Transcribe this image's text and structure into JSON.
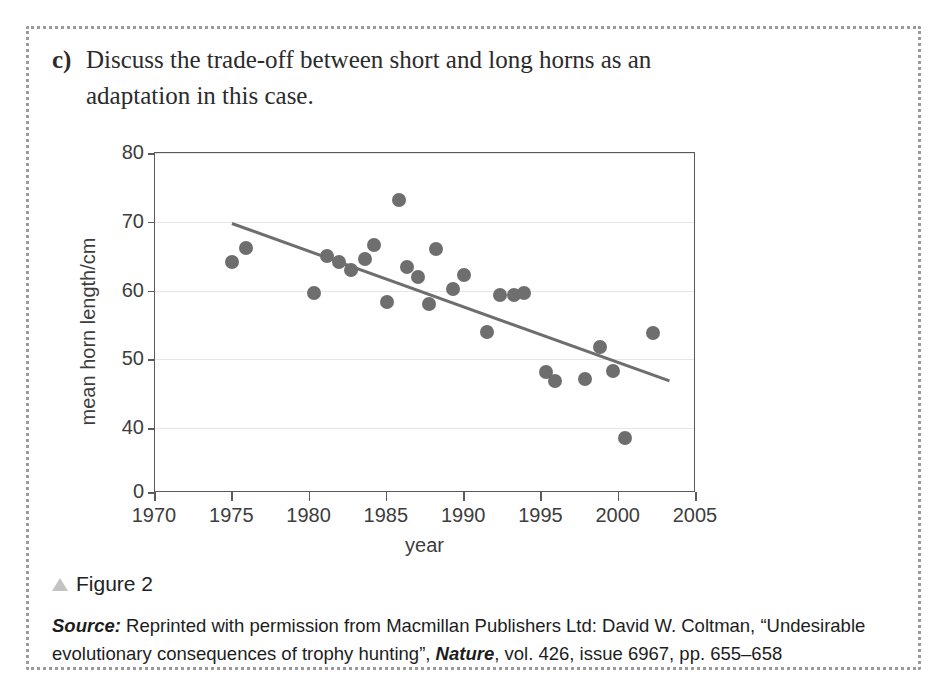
{
  "question": {
    "label": "c)",
    "text": "Discuss the trade-off between short and long horns as an adaptation in this case."
  },
  "figure": {
    "caption": "Figure 2",
    "marker_icon": "triangle-icon"
  },
  "source": {
    "prefix": "Source:",
    "part1": " Reprinted with permission from Macmillan Publishers Ltd: David W. Coltman, “Undesirable evolutionary consequences of trophy hunting”, ",
    "journal": "Nature",
    "part2": ", vol. 426, issue 6967, pp. 655–658"
  },
  "chart_data": {
    "type": "scatter",
    "title": "",
    "xlabel": "year",
    "ylabel": "mean horn length/cm",
    "xlim": [
      1970,
      2005
    ],
    "ylim": [
      35,
      80
    ],
    "y_axis_break": true,
    "y_zero_label": "0",
    "xticks": [
      1970,
      1975,
      1980,
      1985,
      1990,
      1995,
      2000,
      2005
    ],
    "xtick_labels": [
      "1970",
      "1975",
      "1980",
      "1985",
      "1990",
      "1995",
      "2000",
      "2005"
    ],
    "yticks": [
      40,
      50,
      60,
      70,
      80
    ],
    "ytick_labels": [
      "40",
      "50",
      "60",
      "70",
      "80"
    ],
    "grid": "horizontal",
    "marker_color": "#6e6e6e",
    "line_color": "#6e6e6e",
    "points": [
      {
        "x": 1975.0,
        "y": 64.1
      },
      {
        "x": 1975.9,
        "y": 66.2
      },
      {
        "x": 1980.3,
        "y": 59.6
      },
      {
        "x": 1981.1,
        "y": 65.0
      },
      {
        "x": 1981.9,
        "y": 64.1
      },
      {
        "x": 1982.7,
        "y": 63.0
      },
      {
        "x": 1983.6,
        "y": 64.6
      },
      {
        "x": 1984.2,
        "y": 66.6
      },
      {
        "x": 1985.0,
        "y": 58.3
      },
      {
        "x": 1985.8,
        "y": 73.2
      },
      {
        "x": 1986.3,
        "y": 63.4
      },
      {
        "x": 1987.0,
        "y": 62.0
      },
      {
        "x": 1987.7,
        "y": 58.0
      },
      {
        "x": 1988.2,
        "y": 66.0
      },
      {
        "x": 1989.3,
        "y": 60.2
      },
      {
        "x": 1990.0,
        "y": 62.3
      },
      {
        "x": 1991.5,
        "y": 54.0
      },
      {
        "x": 1992.3,
        "y": 59.3
      },
      {
        "x": 1993.2,
        "y": 59.3
      },
      {
        "x": 1993.9,
        "y": 59.6
      },
      {
        "x": 1995.3,
        "y": 48.2
      },
      {
        "x": 1995.9,
        "y": 46.8
      },
      {
        "x": 1997.8,
        "y": 47.2
      },
      {
        "x": 1998.8,
        "y": 51.8
      },
      {
        "x": 1999.6,
        "y": 48.3
      },
      {
        "x": 2000.4,
        "y": 38.6
      },
      {
        "x": 2002.2,
        "y": 53.8
      }
    ],
    "trendline": {
      "x1": 1975.0,
      "y1": 70.0,
      "x2": 2003.3,
      "y2": 47.1
    }
  }
}
